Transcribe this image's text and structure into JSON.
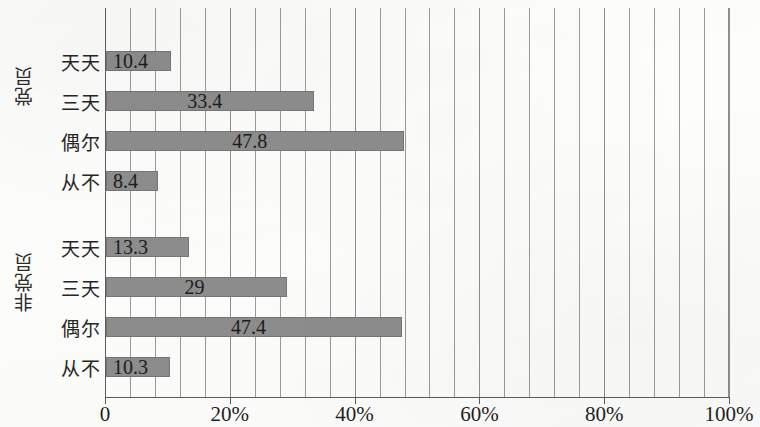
{
  "chart_data": {
    "type": "bar",
    "orientation": "horizontal",
    "title": "",
    "xlabel": "",
    "ylabel": "",
    "xlim": [
      0,
      100
    ],
    "xticks": [
      0,
      20,
      40,
      60,
      80,
      100
    ],
    "xtick_labels": [
      "0",
      "20%",
      "40%",
      "60%",
      "80%",
      "100%"
    ],
    "gridline_interval": 4,
    "grid": true,
    "legend": "none",
    "bar_color": "#8d8d8d",
    "axis_color": "#5c5c5c",
    "categories": [
      "天天",
      "三天",
      "偶尔",
      "从不"
    ],
    "groups": [
      {
        "name": "党员",
        "categories": [
          "天天",
          "三天",
          "偶尔",
          "从不"
        ],
        "values": [
          10.4,
          33.4,
          47.8,
          8.4
        ],
        "labels": [
          "10.4",
          "33.4",
          "47.8",
          "8.4"
        ]
      },
      {
        "name": "非党员",
        "categories": [
          "天天",
          "三天",
          "偶尔",
          "从不"
        ],
        "values": [
          13.3,
          29,
          47.4,
          10.3
        ],
        "labels": [
          "13.3",
          "29",
          "47.4",
          "10.3"
        ]
      }
    ]
  },
  "axis": {
    "x_tick_labels": [
      "0",
      "20%",
      "40%",
      "60%",
      "80%",
      "100%"
    ]
  },
  "groups": {
    "0": {
      "title": "党员"
    },
    "1": {
      "title": "非党员"
    }
  }
}
